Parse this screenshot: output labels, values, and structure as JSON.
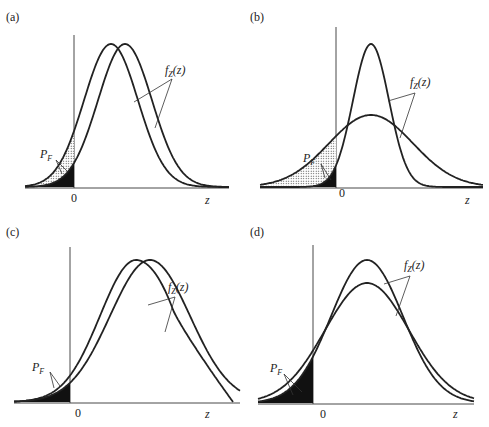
{
  "chart_data": [
    {
      "type": "line",
      "panel": "(a)",
      "title": "(a)",
      "xlabel": "z",
      "origin_label": "0",
      "annotations": [
        "f_Z(z)",
        "P_F"
      ],
      "series": [
        {
          "name": "f_Z(z) curve 1",
          "mean": 0.75,
          "sd": 0.25,
          "peak": 1.0
        },
        {
          "name": "f_Z(z) curve 2",
          "mean": 1.0,
          "sd": 0.25,
          "peak": 1.0
        }
      ],
      "description": "Two equal-variance normal densities shifted; shaded P_F tails left of 0"
    },
    {
      "type": "line",
      "panel": "(b)",
      "title": "(b)",
      "xlabel": "z",
      "origin_label": "0",
      "annotations": [
        "f_Z(z)",
        "P_F"
      ],
      "series": [
        {
          "name": "f_Z(z) narrow",
          "mean": 0.9,
          "sd": 0.17,
          "peak": 1.0
        },
        {
          "name": "f_Z(z) wide",
          "mean": 0.9,
          "sd": 0.42,
          "peak": 0.48
        }
      ],
      "description": "Same mean, different variances; wider curve has larger P_F"
    },
    {
      "type": "line",
      "panel": "(c)",
      "title": "(c)",
      "xlabel": "z",
      "origin_label": "0",
      "annotations": [
        "f_Z(z)",
        "P_F"
      ],
      "series": [
        {
          "name": "f_Z(z) normal",
          "mean": 0.9,
          "sd": 0.33,
          "peak": 1.0
        },
        {
          "name": "f_Z(z) skewed/truncated",
          "mean": 1.05,
          "peak": 1.0
        }
      ],
      "description": "Different distribution shapes with similar left tails, same P_F"
    },
    {
      "type": "line",
      "panel": "(d)",
      "title": "(d)",
      "xlabel": "z",
      "origin_label": "0",
      "annotations": [
        "f_Z(z)",
        "P_F"
      ],
      "series": [
        {
          "name": "f_Z(z) taller",
          "mean": 0.9,
          "sd": 0.3,
          "peak": 1.0
        },
        {
          "name": "f_Z(z) shorter",
          "mean": 0.9,
          "sd": 0.35,
          "peak": 0.86
        }
      ],
      "description": "Similar distributions, nearly equal P_F"
    }
  ],
  "panels": {
    "a": {
      "label": "(a)",
      "fz": "f",
      "fz_sub": "Z",
      "fz_arg": "(z)",
      "pf": "P",
      "pf_sub": "F",
      "zero": "0",
      "z": "z"
    },
    "b": {
      "label": "(b)",
      "fz": "f",
      "fz_sub": "Z",
      "fz_arg": "(z)",
      "pf": "P",
      "pf_sub": "F",
      "zero": "0",
      "z": "z"
    },
    "c": {
      "label": "(c)",
      "fz": "f",
      "fz_sub": "Z",
      "fz_arg": "(z)",
      "pf": "P",
      "pf_sub": "F",
      "zero": "0",
      "z": "z"
    },
    "d": {
      "label": "(d)",
      "fz": "f",
      "fz_sub": "Z",
      "fz_arg": "(z)",
      "pf": "P",
      "pf_sub": "F",
      "zero": "0",
      "z": "z"
    }
  }
}
